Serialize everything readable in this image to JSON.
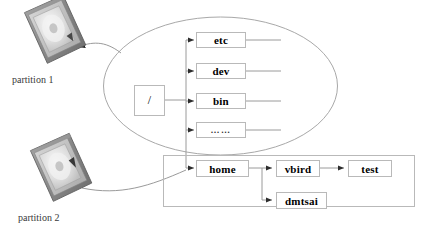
{
  "diagram": {
    "type": "tree-diagram",
    "colors": {
      "box_border": "#b9b9b9",
      "box_fill": "#ffffff",
      "line": "#9a9a9a",
      "ellipse_stroke": "#a8a8a8",
      "text": "#000000",
      "label_text": "#3a3a3a",
      "disk_body": "#8e8e8e",
      "disk_top": "#c9c9c9",
      "disk_platter": "#e6e6e6"
    },
    "disks": [
      {
        "id": "partition-1",
        "label": "partition 1"
      },
      {
        "id": "partition-2",
        "label": "partition 2"
      }
    ],
    "root": {
      "label": "/"
    },
    "top_level_dirs": [
      {
        "label": "etc"
      },
      {
        "label": "dev"
      },
      {
        "label": "bin"
      },
      {
        "label": "……"
      }
    ],
    "home_branch": {
      "home": {
        "label": "home"
      },
      "users": [
        {
          "label": "vbird"
        },
        {
          "label": "dmtsai"
        }
      ],
      "sub": {
        "label": "test"
      }
    }
  }
}
